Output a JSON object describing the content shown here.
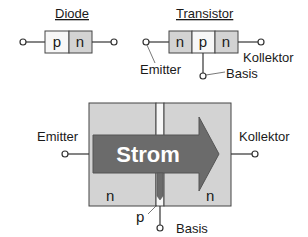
{
  "diode": {
    "title": "Diode",
    "layers": [
      "p",
      "n"
    ]
  },
  "transistor": {
    "title": "Transistor",
    "layers": [
      "n",
      "p",
      "n"
    ],
    "emitter_label": "Emitter",
    "collector_label": "Kollektor",
    "base_label": "Basis"
  },
  "large_diagram": {
    "emitter_label": "Emitter",
    "collector_label": "Kollektor",
    "base_label": "Basis",
    "current_label": "Strom",
    "left_region": "n",
    "right_region": "n",
    "base_region": "p"
  },
  "colors": {
    "n_fill": "#d3d3d3",
    "p_fill": "#f7f7f7",
    "arrow_fill": "#6b6b6b",
    "outline": "#444444"
  }
}
